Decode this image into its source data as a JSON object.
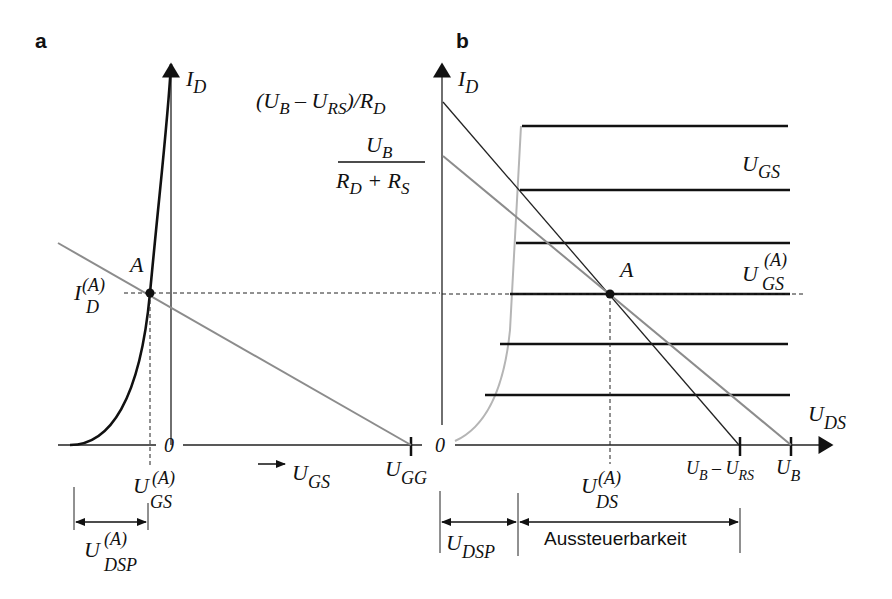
{
  "figure": {
    "panels": [
      {
        "id": "a",
        "label": "a",
        "y_axis_label": "I",
        "y_axis_sub": "D",
        "x_axis_label": "U",
        "x_axis_sub": "GS",
        "origin_label": "0",
        "x_end_label": "U",
        "x_end_sub": "GG",
        "point_label": "A",
        "id_a_label": "I",
        "id_a_sub": "D",
        "id_a_sup": "(A)",
        "ugs_a_label": "U",
        "ugs_a_sub": "GS",
        "ugs_a_sup": "(A)",
        "udsp_a_label": "U",
        "udsp_a_sub": "DSP",
        "udsp_a_sup": "(A)"
      },
      {
        "id": "b",
        "label": "b",
        "y_axis_label": "I",
        "y_axis_sub": "D",
        "x_axis_label": "U",
        "x_axis_sub": "DS",
        "origin_label": "0",
        "intercept1": {
          "open": "(U",
          "b_sub": "B",
          "minus": " – U",
          "rs_sub": "RS",
          "close": ")/R",
          "d_sub": "D"
        },
        "intercept2": {
          "num": "U",
          "num_sub": "B",
          "den_r1": "R",
          "den_sub1": "D",
          "den_plus": " + R",
          "den_sub2": "S"
        },
        "family_label": "U",
        "family_sub": "GS",
        "ugs_a_label": "U",
        "ugs_a_sub": "GS",
        "ugs_a_sup": "(A)",
        "point_label": "A",
        "uds_a_label": "U",
        "uds_a_sub": "DS",
        "uds_a_sup": "(A)",
        "tick1": {
          "u": "U",
          "b": "B",
          "minus": " – U",
          "rs": "RS"
        },
        "tick2": {
          "u": "U",
          "b": "B"
        },
        "udsp_label": "U",
        "udsp_sub": "DSP",
        "range_label": "Aussteuerbarkeit"
      }
    ],
    "colors": {
      "curve": "#111111",
      "load_line_gray": "#8c8c8c",
      "transfer_gray": "#b5b5b5",
      "axis": "#222222"
    }
  }
}
